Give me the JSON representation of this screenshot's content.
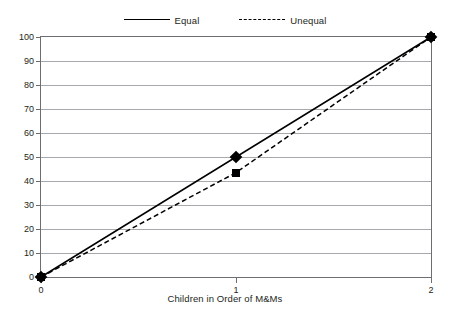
{
  "chart_data": {
    "type": "line",
    "title": "",
    "xlabel": "Children in Order of M&Ms",
    "ylabel": "",
    "x": [
      0,
      1,
      2
    ],
    "xticklabels": [
      "0",
      "1",
      "2"
    ],
    "xlim": [
      0,
      2
    ],
    "ylim": [
      0,
      100
    ],
    "yticks": [
      0,
      10,
      20,
      30,
      40,
      50,
      60,
      70,
      80,
      90,
      100
    ],
    "yticklabels": [
      "0",
      "10",
      "20",
      "30",
      "40",
      "50",
      "60",
      "70",
      "80",
      "90",
      "100"
    ],
    "grid": "horizontal",
    "legend_position": "top-center",
    "series": [
      {
        "name": "Equal",
        "values": [
          0,
          50,
          100
        ],
        "line_style": "solid",
        "marker": "diamond",
        "color": "#000000"
      },
      {
        "name": "Unequal",
        "values": [
          0,
          43.5,
          100
        ],
        "line_style": "dashed",
        "marker": "square",
        "color": "#000000"
      }
    ]
  },
  "colors": {
    "line": "#000000",
    "grid": "#a7a9ac",
    "axis": "#6d6e71",
    "text": "#231f20",
    "background": "#ffffff"
  },
  "legend": {
    "items": [
      {
        "label": "Equal"
      },
      {
        "label": "Unequal"
      }
    ]
  }
}
